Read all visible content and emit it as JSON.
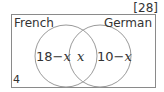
{
  "marks": "[28]",
  "universal_set": {
    "sets": [
      {
        "name": "French",
        "label": "French"
      },
      {
        "name": "German",
        "label": "German"
      }
    ],
    "outside_value": "4"
  },
  "regions": {
    "french_only": {
      "number": "18",
      "op": "−",
      "var": "x"
    },
    "both": {
      "var": "x"
    },
    "german_only": {
      "number": "10",
      "op": "−",
      "var": "x"
    }
  },
  "colors": {
    "stroke": "#8a8a8a",
    "text": "#333333"
  }
}
